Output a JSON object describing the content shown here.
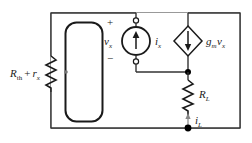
{
  "figure": {
    "type": "circuit-schematic"
  },
  "colors": {
    "wire": "#333333",
    "frame": "#999999",
    "component": "#1a1a1a",
    "background": "#ffffff",
    "node": "#000000"
  },
  "labels": {
    "thevenin": {
      "symbol": "R",
      "subscript": "th",
      "operator": "+",
      "symbol2": "r",
      "subscript2": "x"
    },
    "test_voltage": {
      "symbol": "v",
      "subscript": "x"
    },
    "test_current": {
      "symbol": "i",
      "subscript": "x"
    },
    "dependent_source": {
      "gain": "g",
      "gain_sub": "m",
      "control": "v",
      "control_sub": "x"
    },
    "load_resistor": {
      "symbol": "R",
      "subscript": "L"
    },
    "load_current": {
      "symbol": "i",
      "subscript": "L"
    },
    "polarity_plus": "+",
    "polarity_minus": "−"
  },
  "components": [
    {
      "name": "thevenin-resistor",
      "kind": "resistor",
      "label": "R_th + r_x"
    },
    {
      "name": "input-loop",
      "kind": "rounded-loop"
    },
    {
      "name": "test-current-source",
      "kind": "independent-current-source",
      "arrow": "up",
      "label": "i_x"
    },
    {
      "name": "dependent-current-source",
      "kind": "vccs-diamond",
      "arrow": "down",
      "label": "g_m v_x"
    },
    {
      "name": "load-resistor",
      "kind": "resistor",
      "label": "R_L"
    }
  ]
}
